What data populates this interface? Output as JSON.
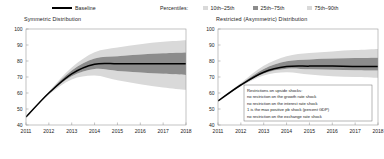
{
  "legend": {
    "baseline_label": "Baseline",
    "percentiles_label": "Percentiles:",
    "bands": [
      {
        "label": "10th–25th",
        "color": "#d9d9d9"
      },
      {
        "label": "25th–75th",
        "color": "#8c8c8c"
      },
      {
        "label": "75th–90th",
        "color": "#d9d9d9"
      }
    ],
    "baseline_color": "#000000"
  },
  "panels": [
    {
      "id": "symmetric",
      "title": "Symmetric Distribution"
    },
    {
      "id": "restricted",
      "title": "Restricted (Asymmetric) Distribution"
    }
  ],
  "annotation": {
    "lines": [
      "Restrictions on upside shocks:",
      "no restriction on the growth rate shock",
      "no restriction on the interest rate shock",
      "1 is the max positive pb shock (percent GDP)",
      "no restriction on the exchange rate shock"
    ]
  },
  "chart_data": [
    {
      "type": "area",
      "title": "Symmetric Distribution",
      "xlabel": "",
      "ylabel": "",
      "x": [
        2011,
        2012,
        2013,
        2014,
        2015,
        2016,
        2017,
        2018
      ],
      "xlim": [
        2011,
        2018
      ],
      "ylim": [
        40,
        100
      ],
      "yticks": [
        40,
        50,
        60,
        70,
        80,
        90,
        100
      ],
      "xticks": [
        "2011",
        "2012",
        "2013",
        "2014",
        "2015",
        "2016",
        "2017",
        "2018"
      ],
      "grid": false,
      "legend": "top",
      "series": [
        {
          "name": "Baseline",
          "values": [
            45.0,
            60.0,
            72.0,
            78.0,
            78.3,
            78.3,
            78.3,
            78.3
          ]
        },
        {
          "name": "10th",
          "values": [
            45.0,
            59.0,
            68.5,
            71.0,
            68.0,
            65.5,
            63.5,
            62.0
          ]
        },
        {
          "name": "25th",
          "values": [
            45.0,
            59.6,
            70.5,
            75.0,
            73.8,
            72.8,
            72.0,
            71.3
          ]
        },
        {
          "name": "75th",
          "values": [
            45.0,
            60.4,
            74.0,
            81.5,
            83.0,
            84.0,
            84.8,
            85.3
          ]
        },
        {
          "name": "90th",
          "values": [
            45.0,
            61.0,
            76.0,
            85.5,
            88.5,
            90.5,
            92.0,
            93.0
          ]
        }
      ]
    },
    {
      "type": "area",
      "title": "Restricted (Asymmetric) Distribution",
      "xlabel": "",
      "ylabel": "",
      "x": [
        2011,
        2012,
        2013,
        2014,
        2015,
        2016,
        2017,
        2018
      ],
      "xlim": [
        2011,
        2018
      ],
      "ylim": [
        40,
        100
      ],
      "yticks": [
        40,
        50,
        60,
        70,
        80,
        90,
        100
      ],
      "xticks": [
        "2011",
        "2012",
        "2013",
        "2014",
        "2015",
        "2016",
        "2017",
        "2018"
      ],
      "grid": false,
      "legend": "top",
      "series": [
        {
          "name": "Baseline",
          "values": [
            55.0,
            65.0,
            73.0,
            76.5,
            76.8,
            76.8,
            76.6,
            76.5
          ]
        },
        {
          "name": "10th",
          "values": [
            55.0,
            64.2,
            71.0,
            73.0,
            71.5,
            70.5,
            70.0,
            69.5
          ]
        },
        {
          "name": "25th",
          "values": [
            55.0,
            64.6,
            72.2,
            75.2,
            74.8,
            74.5,
            74.2,
            74.0
          ]
        },
        {
          "name": "75th",
          "values": [
            55.0,
            65.6,
            75.0,
            79.8,
            81.0,
            81.5,
            81.8,
            82.0
          ]
        },
        {
          "name": "90th",
          "values": [
            55.0,
            66.2,
            77.0,
            83.0,
            85.0,
            86.0,
            86.8,
            87.5
          ]
        }
      ]
    }
  ]
}
